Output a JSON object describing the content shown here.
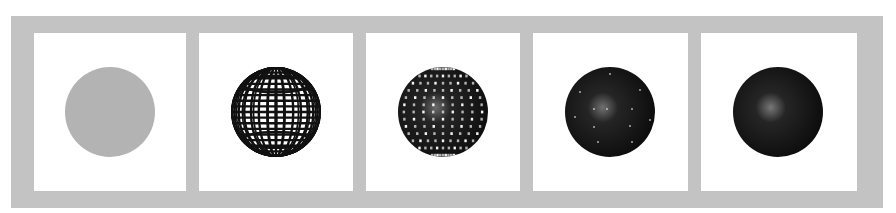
{
  "figure": {
    "frame_color": "#c3c3c3",
    "panel_color": "#ffffff",
    "panels": [
      {
        "id": "flat",
        "stage": "flat-disc",
        "left": 34,
        "width": 152,
        "sphere": {
          "cx": 76,
          "cy": 79,
          "r": 45
        },
        "fill": "#b3b3b3"
      },
      {
        "id": "wireframe",
        "stage": "wireframe-sphere",
        "left": 199,
        "width": 154,
        "sphere": {
          "cx": 77,
          "cy": 79,
          "r": 45
        },
        "stroke": "#111111"
      },
      {
        "id": "shaded-gaps",
        "stage": "shaded-with-gaps",
        "left": 366,
        "width": 154,
        "sphere": {
          "cx": 77,
          "cy": 79,
          "r": 45
        },
        "fill": "#0e0e0e",
        "highlight": "#6a6a6a"
      },
      {
        "id": "shaded-sparse",
        "stage": "shaded-sparse-gaps",
        "left": 533,
        "width": 155,
        "sphere": {
          "cx": 77,
          "cy": 79,
          "r": 45
        },
        "fill": "#0c0c0c",
        "highlight": "#707070"
      },
      {
        "id": "shaded-solid",
        "stage": "fully-shaded",
        "left": 701,
        "width": 156,
        "sphere": {
          "cx": 77,
          "cy": 79,
          "r": 45
        },
        "fill": "#0c0c0c",
        "highlight": "#777777"
      }
    ]
  }
}
